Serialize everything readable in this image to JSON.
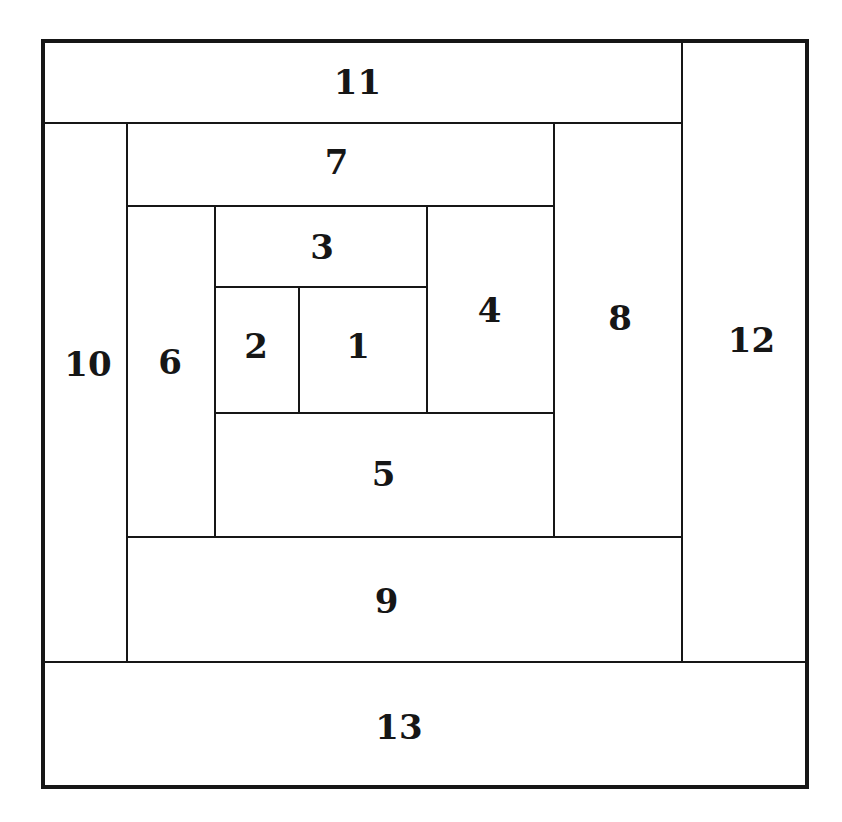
{
  "diagram": {
    "background_color": "#ffffff",
    "line_color": "#161616",
    "frame": {
      "x": 41,
      "y": 39,
      "w": 768,
      "h": 750,
      "stroke": 4
    },
    "cells": [
      {
        "label": "1",
        "x": 299,
        "y": 287,
        "w": 128,
        "h": 126,
        "dx": -5,
        "dy": -4
      },
      {
        "label": "2",
        "x": 215,
        "y": 287,
        "w": 84,
        "h": 126,
        "dx": -1,
        "dy": -4
      },
      {
        "label": "3",
        "x": 215,
        "y": 206,
        "w": 212,
        "h": 81,
        "dx": 1,
        "dy": 0
      },
      {
        "label": "4",
        "x": 427,
        "y": 206,
        "w": 127,
        "h": 207,
        "dx": -1,
        "dy": 0
      },
      {
        "label": "5",
        "x": 215,
        "y": 413,
        "w": 339,
        "h": 124,
        "dx": -1,
        "dy": -1
      },
      {
        "label": "6",
        "x": 127,
        "y": 206,
        "w": 88,
        "h": 331,
        "dx": -1,
        "dy": -10
      },
      {
        "label": "7",
        "x": 127,
        "y": 123,
        "w": 427,
        "h": 83,
        "dx": -4,
        "dy": -3
      },
      {
        "label": "8",
        "x": 554,
        "y": 123,
        "w": 128,
        "h": 414,
        "dx": 2,
        "dy": -12
      },
      {
        "label": "9",
        "x": 127,
        "y": 537,
        "w": 555,
        "h": 125,
        "dx": -18,
        "dy": 1
      },
      {
        "label": "10",
        "x": 43,
        "y": 123,
        "w": 84,
        "h": 539,
        "dx": 3,
        "dy": -29
      },
      {
        "label": "11",
        "x": 43,
        "y": 41,
        "w": 639,
        "h": 82,
        "dx": -5,
        "dy": 0
      },
      {
        "label": "12",
        "x": 682,
        "y": 41,
        "w": 125,
        "h": 621,
        "dx": 7,
        "dy": -12
      },
      {
        "label": "13",
        "x": 43,
        "y": 662,
        "w": 764,
        "h": 125,
        "dx": -26,
        "dy": 2
      }
    ],
    "h_lines": [
      {
        "x1": 43,
        "x2": 682,
        "y": 123
      },
      {
        "x1": 127,
        "x2": 554,
        "y": 206
      },
      {
        "x1": 215,
        "x2": 427,
        "y": 287
      },
      {
        "x1": 215,
        "x2": 554,
        "y": 413
      },
      {
        "x1": 127,
        "x2": 682,
        "y": 537
      },
      {
        "x1": 43,
        "x2": 807,
        "y": 662
      }
    ],
    "v_lines": [
      {
        "x": 127,
        "y1": 123,
        "y2": 662
      },
      {
        "x": 215,
        "y1": 206,
        "y2": 537
      },
      {
        "x": 299,
        "y1": 287,
        "y2": 413
      },
      {
        "x": 427,
        "y1": 206,
        "y2": 413
      },
      {
        "x": 554,
        "y1": 123,
        "y2": 537
      },
      {
        "x": 682,
        "y1": 41,
        "y2": 662
      }
    ],
    "line_thickness": 2.5
  }
}
